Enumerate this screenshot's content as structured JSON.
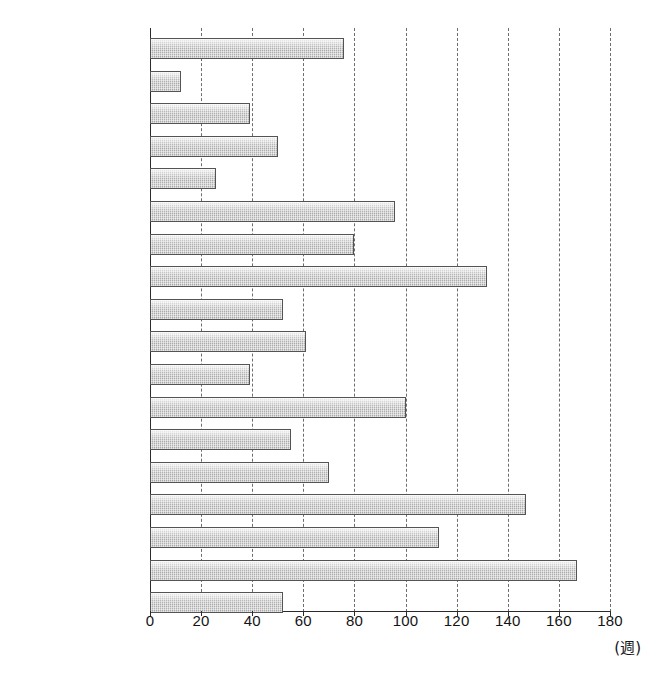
{
  "chart_data": {
    "type": "bar",
    "orientation": "horizontal",
    "title": "",
    "xlabel": "(週)",
    "ylabel": "",
    "xlim": [
      0,
      180
    ],
    "xticks": [
      0,
      20,
      40,
      60,
      80,
      100,
      120,
      140,
      160,
      180
    ],
    "grid": "vertical-dashed",
    "legend": "none",
    "unit": "週",
    "categories": [
      "Lieberman 2003",
      "Wiersma 2000",
      "Amminger 2002",
      "Malla 2002",
      "Linszenet 2001",
      "Verdoux 2001",
      "Black 2001",
      "Larsen 2000",
      "Hoff 2000",
      "Ho 2000",
      "Drake 2000",
      "Browne 2000",
      "Barnes 2000",
      "Robinson 1999",
      "McGorry 1996",
      "Larsen 1996",
      "Szymanski 1996",
      "Loebel 1992"
    ],
    "values": [
      76,
      12,
      39,
      50,
      26,
      96,
      80,
      132,
      52,
      61,
      39,
      100,
      55,
      70,
      147,
      113,
      167,
      52
    ]
  },
  "caption": ""
}
